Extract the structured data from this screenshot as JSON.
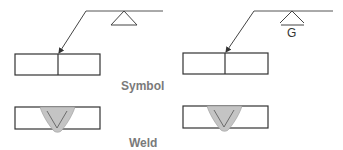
{
  "labels": {
    "symbol": "Symbol",
    "weld": "Weld",
    "finish_letter": "G"
  },
  "colors": {
    "line": "#333333",
    "weld_fill": "#c4c4c4",
    "label": "#7a7a7a",
    "background": "#ffffff"
  },
  "panels": [
    {
      "name": "left",
      "finish": null
    },
    {
      "name": "right",
      "finish": "G"
    }
  ]
}
